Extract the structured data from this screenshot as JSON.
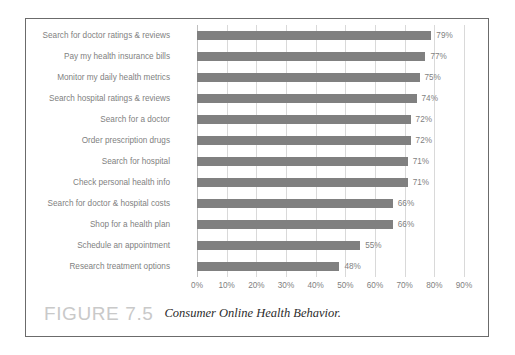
{
  "figure": {
    "number_label": "FIGURE 7.5",
    "caption": "Consumer Online Health Behavior."
  },
  "chart_data": {
    "type": "bar",
    "orientation": "horizontal",
    "title": "",
    "xlabel": "",
    "ylabel": "",
    "xlim": [
      0,
      90
    ],
    "grid": true,
    "legend": "none",
    "value_suffix": "%",
    "bar_color": "#808080",
    "gridline_color": "#d9d9d9",
    "text_color": "#7f7f7f",
    "xticks": [
      "0%",
      "10%",
      "20%",
      "30%",
      "40%",
      "50%",
      "60%",
      "70%",
      "80%",
      "90%"
    ],
    "xtick_values": [
      0,
      10,
      20,
      30,
      40,
      50,
      60,
      70,
      80,
      90
    ],
    "categories": [
      "Search for doctor ratings & reviews",
      "Pay my health insurance bills",
      "Monitor my daily health metrics",
      "Search hospital ratings & reviews",
      "Search for a doctor",
      "Order prescription drugs",
      "Search for hospital",
      "Check personal health info",
      "Search for doctor & hospital costs",
      "Shop for a health plan",
      "Schedule an appointment",
      "Research treatment options"
    ],
    "values": [
      79,
      77,
      75,
      74,
      72,
      72,
      71,
      71,
      66,
      66,
      55,
      48
    ],
    "value_labels": [
      "79%",
      "77%",
      "75%",
      "74%",
      "72%",
      "72%",
      "71%",
      "71%",
      "66%",
      "66%",
      "55%",
      "48%"
    ]
  }
}
